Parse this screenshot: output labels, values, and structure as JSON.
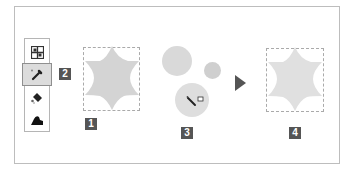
{
  "toolbar": {
    "tools": [
      {
        "name": "pattern-stamp",
        "icon": "pattern-stamp-icon",
        "selected": false
      },
      {
        "name": "eyedropper",
        "icon": "eyedropper-icon",
        "selected": true
      },
      {
        "name": "paint-bucket",
        "icon": "paint-bucket-icon",
        "selected": false
      },
      {
        "name": "eraser",
        "icon": "eraser-icon",
        "selected": false
      }
    ]
  },
  "steps": {
    "step1": "1",
    "step2": "2",
    "step3": "3",
    "step4": "4"
  },
  "colors": {
    "shape_fill": "#d4d4d4",
    "badge_bg": "#555555",
    "selection_border": "#aaaaaa",
    "arrow": "#555555"
  }
}
